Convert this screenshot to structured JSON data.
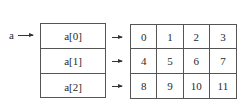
{
  "pointer": {
    "label": "a"
  },
  "row_pointers": [
    {
      "label": "a[0]"
    },
    {
      "label": "a[1]"
    },
    {
      "label": "a[2]"
    }
  ],
  "grid": {
    "rows": [
      [
        "0",
        "1",
        "2",
        "3"
      ],
      [
        "4",
        "5",
        "6",
        "7"
      ],
      [
        "8",
        "9",
        "10",
        "11"
      ]
    ]
  }
}
